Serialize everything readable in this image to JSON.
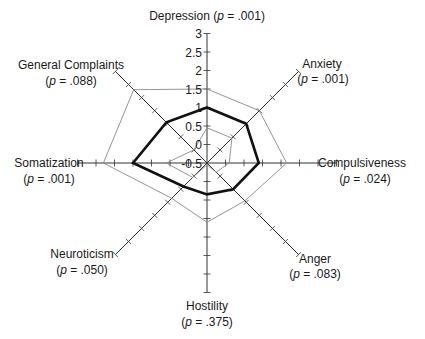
{
  "chart_data": {
    "type": "radar",
    "title": "",
    "scale": {
      "min": -0.5,
      "max": 3,
      "ticks": [
        -0.5,
        0,
        0.5,
        1,
        1.5,
        2,
        2.5,
        3
      ],
      "tick_labels": [
        "-0.5",
        "0",
        "0.5",
        "1",
        "1.5",
        "2",
        "2.5",
        "3"
      ]
    },
    "axes": [
      {
        "name": "Depression",
        "p": "(p = .001)",
        "p_value": ".001"
      },
      {
        "name": "Anxiety",
        "p": "(p = .001)",
        "p_value": ".001"
      },
      {
        "name": "Compulsiveness",
        "p": "(p = .024)",
        "p_value": ".024"
      },
      {
        "name": "Anger",
        "p": "(p = .083)",
        "p_value": ".083"
      },
      {
        "name": "Hostility",
        "p": "(p = .375)",
        "p_value": ".375"
      },
      {
        "name": "Neuroticism",
        "p": "(p = .050)",
        "p_value": ".050"
      },
      {
        "name": "Somatization",
        "p": "(p = .001)",
        "p_value": ".001"
      },
      {
        "name": "General Complaints",
        "p": "(p = .088)",
        "p_value": ".088"
      }
    ],
    "series": [
      {
        "name": "Series A (bold)",
        "style": "bold",
        "color": "#111111",
        "values": [
          1.0,
          1.0,
          0.9,
          0.5,
          0.35,
          0.4,
          1.5,
          1.05
        ]
      },
      {
        "name": "Series B (outer thin)",
        "style": "thin",
        "color": "#8a8a8a",
        "values": [
          1.5,
          1.5,
          1.65,
          0.95,
          1.1,
          0.85,
          2.3,
          2.3
        ]
      },
      {
        "name": "Series C (inner thin)",
        "style": "thin",
        "color": "#8a8a8a",
        "values": [
          0.45,
          0.45,
          0.1,
          -0.15,
          -0.45,
          0.05,
          0.6,
          0.0
        ]
      }
    ],
    "legend": null,
    "grid": false
  },
  "labels": {
    "depression": "Depression (p = .001)",
    "anxiety_name": "Anxiety",
    "anxiety_p": "(p = .001)",
    "compulsiveness_name": "Compulsiveness",
    "compulsiveness_p": "(p = .024)",
    "anger_name": "Anger",
    "anger_p": "(p = .083)",
    "hostility_name": "Hostility",
    "hostility_p": "(p = .375)",
    "neuroticism_name": "Neuroticism",
    "neuroticism_p": "(p = .050)",
    "somatization_name": "Somatization",
    "somatization_p": "(p = .001)",
    "general_name": "General Complaints",
    "general_p": "(p = .088)"
  }
}
